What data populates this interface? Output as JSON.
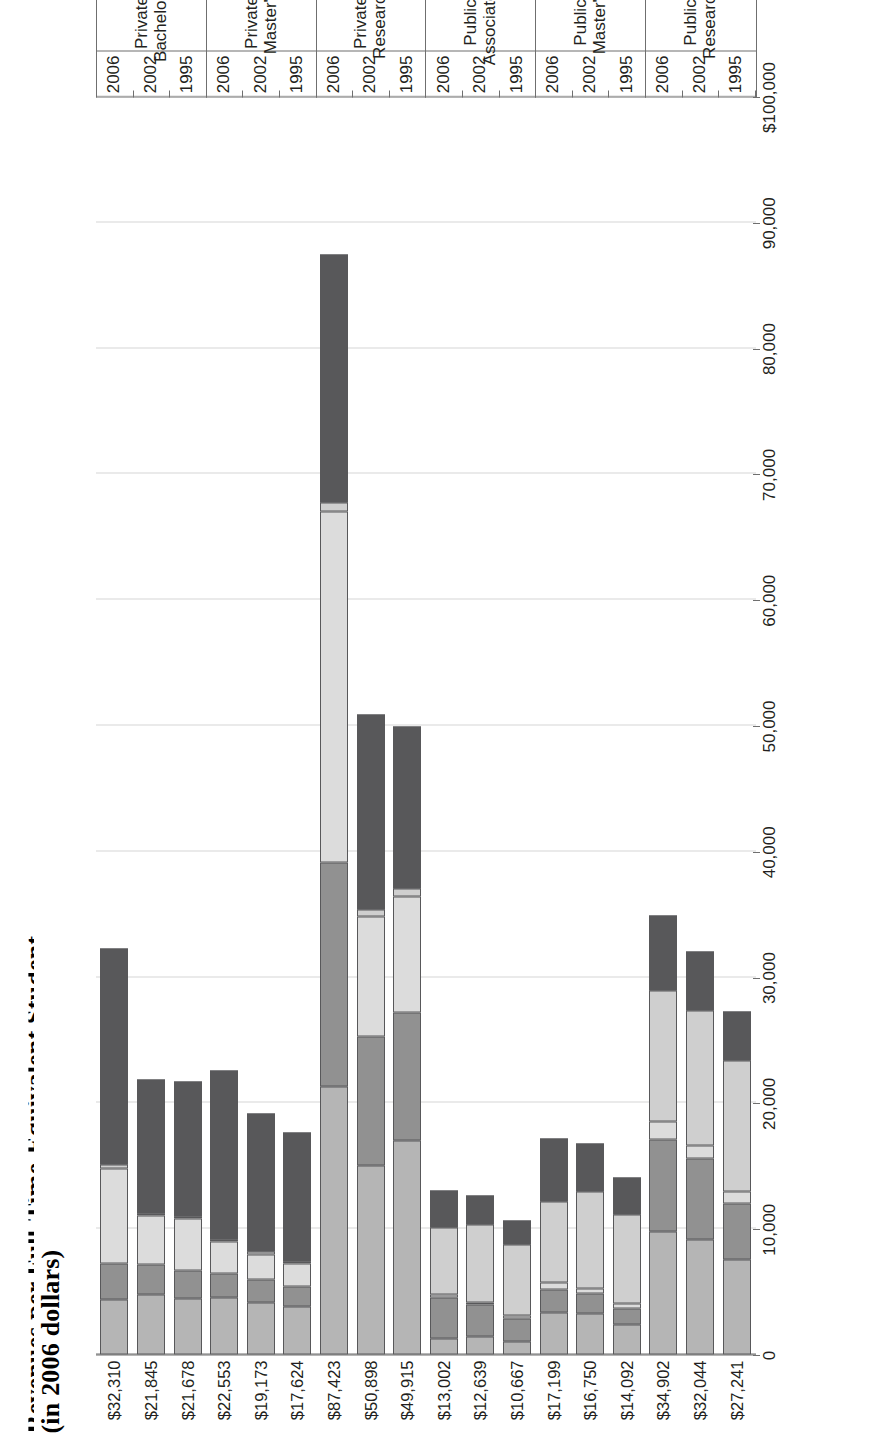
{
  "title": {
    "line1": "Revenues per Full-Time-Equivalent Student",
    "line2": "(in 2006 dollars)"
  },
  "axis": {
    "label": "",
    "ticks": [
      "$100,000",
      "90,000",
      "80,000",
      "70,000",
      "60,000",
      "50,000",
      "40,000",
      "30,000",
      "20,000",
      "10,000",
      "0"
    ],
    "max": 100000,
    "min": 0,
    "step": 10000
  },
  "legend": {
    "items": [
      {
        "name": "auxiliary",
        "label": "Auxiliary Enterprises, Hospitals, Independent\nOperations and Other Sources",
        "color": "#58585a"
      },
      {
        "name": "federal",
        "label": "Federal Appropriations, Grants & Contracts\nand State/Local Grants & Contracts",
        "color": "#cfcfcf"
      },
      {
        "name": "private-gifts",
        "label": "Private Gifts, Investment Returns\nand Endowment Income",
        "color": "#dcdcdc"
      },
      {
        "name": "state-local",
        "label": "State/Local Appropriations",
        "color": "#919191"
      },
      {
        "name": "net-tuition",
        "label": "Net Tuition",
        "color": "#b5b5b5"
      }
    ]
  },
  "chart_data": {
    "type": "bar",
    "orientation": "horizontal-stacked",
    "title": "Revenues per Full-Time-Equivalent Student (in 2006 dollars)",
    "xlabel": "",
    "ylabel": "",
    "xlim": [
      0,
      100000
    ],
    "grid": true,
    "legend_position": "below",
    "series": [
      {
        "name": "Net Tuition",
        "color": "#b5b5b5"
      },
      {
        "name": "State/Local Appropriations",
        "color": "#919191"
      },
      {
        "name": "Private Gifts, Investment Returns and Endowment Income",
        "color": "#dcdcdc"
      },
      {
        "name": "Federal Appropriations, Grants & Contracts and State/Local Grants & Contracts",
        "color": "#cfcfcf"
      },
      {
        "name": "Auxiliary Enterprises, Hospitals, Independent Operations and Other Sources",
        "color": "#58585a"
      }
    ],
    "groups": [
      {
        "name": "Public Research",
        "rows": [
          {
            "year": "1995",
            "total": "$27,241",
            "total_value": 27241,
            "values": [
              3900,
              10400,
              900,
              4500,
              7541
            ]
          },
          {
            "year": "2002",
            "total": "$32,044",
            "total_value": 32044,
            "values": [
              4700,
              10700,
              1100,
              6400,
              9144
            ]
          },
          {
            "year": "2006",
            "total": "$34,902",
            "total_value": 34902,
            "values": [
              6000,
              10400,
              1400,
              7300,
              9802
            ]
          }
        ]
      },
      {
        "name": "Public Master's",
        "rows": [
          {
            "year": "1995",
            "total": "$14,092",
            "total_value": 14092,
            "values": [
              3000,
              7000,
              400,
              1300,
              2392
            ]
          },
          {
            "year": "2002",
            "total": "$16,750",
            "total_value": 16750,
            "values": [
              3800,
              7700,
              400,
              1600,
              3250
            ]
          },
          {
            "year": "2006",
            "total": "$17,199",
            "total_value": 17199,
            "values": [
              5000,
              6500,
              500,
              1900,
              3299
            ]
          }
        ]
      },
      {
        "name": "Public Associate's",
        "rows": [
          {
            "year": "1995",
            "total": "$10,667",
            "total_value": 10667,
            "values": [
              1900,
              5700,
              200,
              1800,
              1067
            ]
          },
          {
            "year": "2002",
            "total": "$12,639",
            "total_value": 12639,
            "values": [
              2300,
              6200,
              200,
              2500,
              1439
            ]
          },
          {
            "year": "2006",
            "total": "$13,002",
            "total_value": 13002,
            "values": [
              2900,
              5300,
              300,
              3200,
              1302
            ]
          }
        ]
      },
      {
        "name": "Private Research",
        "rows": [
          {
            "year": "1995",
            "total": "$49,915",
            "total_value": 49915,
            "values": [
              12900,
              600,
              9200,
              10200,
              17015
            ]
          },
          {
            "year": "2002",
            "total": "$50,898",
            "total_value": 50898,
            "values": [
              15500,
              600,
              9500,
              10300,
              14998
            ]
          },
          {
            "year": "2006",
            "total": "$87,423",
            "total_value": 87423,
            "values": [
              19700,
              700,
              27900,
              17800,
              21323
            ]
          }
        ]
      },
      {
        "name": "Private Master's",
        "rows": [
          {
            "year": "1995",
            "total": "$17,624",
            "total_value": 17624,
            "values": [
              10200,
              200,
              1800,
              1600,
              3824
            ]
          },
          {
            "year": "2002",
            "total": "$19,173",
            "total_value": 19173,
            "values": [
              11000,
              200,
              2000,
              1800,
              4173
            ]
          },
          {
            "year": "2006",
            "total": "$22,553",
            "total_value": 22553,
            "values": [
              13400,
              200,
              2500,
              1900,
              4553
            ]
          }
        ]
      },
      {
        "name": "Private Bachelor's",
        "rows": [
          {
            "year": "1995",
            "total": "$21,678",
            "total_value": 21678,
            "values": [
              10700,
              200,
              4100,
              2200,
              4478
            ]
          },
          {
            "year": "2002",
            "total": "$21,845",
            "total_value": 21845,
            "values": [
              10600,
              200,
              3900,
              2400,
              4745
            ]
          },
          {
            "year": "2006",
            "total": "$32,310",
            "total_value": 32310,
            "values": [
              17200,
              300,
              7600,
              2800,
              4410
            ]
          }
        ]
      }
    ]
  }
}
